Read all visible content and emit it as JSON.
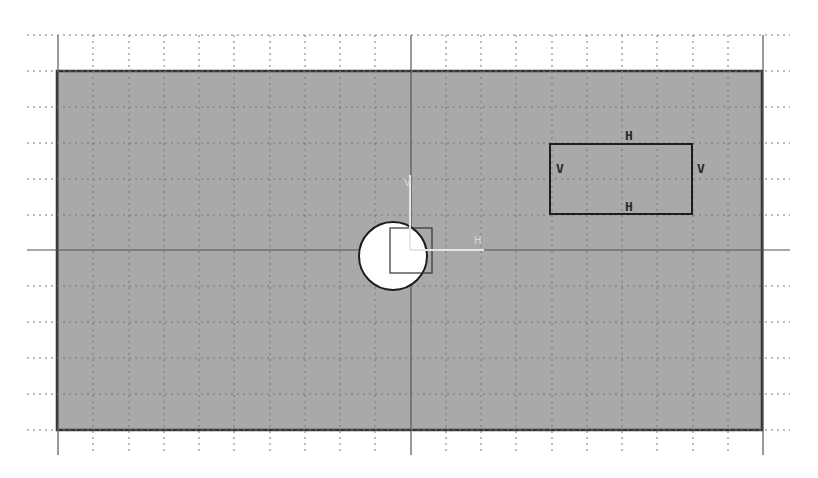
{
  "viewport": {
    "background": "#ffffff",
    "grid": {
      "spacing": 35.25,
      "x_start": 58,
      "x_end": 762,
      "y_start": 35,
      "y_end": 430,
      "vertical_extent": [
        35,
        455
      ],
      "horizontal_extent": [
        27,
        790
      ],
      "color": "#666666",
      "origin_x": 410,
      "origin_y": 250
    },
    "sheet": {
      "x": 57,
      "y": 71,
      "width": 705,
      "height": 359,
      "fill": "#a9a9a9",
      "border": "#333333"
    },
    "axis": {
      "h_label": "H",
      "v_label": "V",
      "color": "#e6e6e6"
    }
  },
  "sketch": {
    "rectangle": {
      "x": 550,
      "y": 144,
      "width": 142,
      "height": 70,
      "stroke": "#1e1e1e"
    },
    "constraints": {
      "top": "H",
      "bottom": "H",
      "left": "V",
      "right": "V"
    },
    "circle": {
      "cx": 393,
      "cy": 256,
      "r": 34,
      "fill": "#ffffff",
      "stroke": "#1e1e1e"
    },
    "origin_square": {
      "x": 390,
      "y": 228,
      "width": 42,
      "height": 45
    }
  }
}
